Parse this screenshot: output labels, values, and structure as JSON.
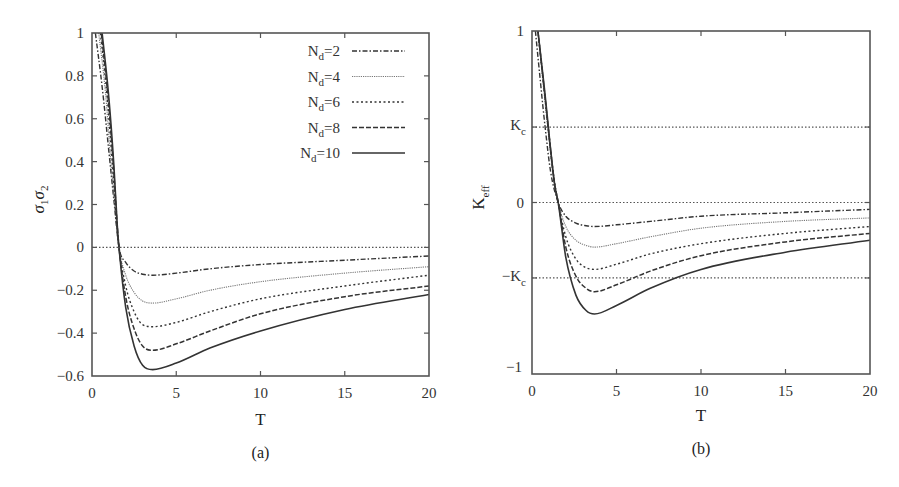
{
  "figure": {
    "panels": [
      "(a)",
      "(b)"
    ]
  },
  "chart_data": [
    {
      "type": "line",
      "panel_label": "(a)",
      "title": "",
      "xlabel": "T",
      "ylabel": "σ1σ2",
      "xlim": [
        0,
        20
      ],
      "ylim": [
        -0.6,
        1
      ],
      "xticks": [
        0,
        5,
        10,
        15,
        20
      ],
      "xtick_labels": [
        "0",
        "5",
        "10",
        "15",
        "20"
      ],
      "yticks": [
        1,
        0.8,
        0.6,
        0.4,
        0.2,
        0,
        -0.2,
        -0.4,
        -0.6
      ],
      "ytick_labels": [
        "1",
        "0.8",
        "0.6",
        "0.4",
        "0.2",
        "0",
        "−0.2",
        "−0.4",
        "−0.6"
      ],
      "grid": false,
      "legend_position": "upper right",
      "reference_lines": [
        {
          "y": 0,
          "style": "dotted"
        }
      ],
      "series": [
        {
          "name": "Nd=2",
          "style": "dashdot",
          "x": [
            0.2,
            0.6,
            1.0,
            1.3,
            1.6,
            2.0,
            2.5,
            3.0,
            3.6,
            5,
            7,
            10,
            15,
            20
          ],
          "y": [
            1.0,
            0.75,
            0.45,
            0.22,
            0.0,
            -0.07,
            -0.11,
            -0.125,
            -0.13,
            -0.12,
            -0.1,
            -0.08,
            -0.06,
            -0.04
          ]
        },
        {
          "name": "Nd=4",
          "style": "dotted-fine",
          "x": [
            0.4,
            0.8,
            1.1,
            1.4,
            1.6,
            2.0,
            2.5,
            3.0,
            3.6,
            5,
            7,
            10,
            15,
            20
          ],
          "y": [
            1.0,
            0.72,
            0.42,
            0.15,
            0.0,
            -0.13,
            -0.21,
            -0.25,
            -0.26,
            -0.24,
            -0.2,
            -0.16,
            -0.12,
            -0.09
          ]
        },
        {
          "name": "Nd=6",
          "style": "dotted",
          "x": [
            0.5,
            0.9,
            1.2,
            1.45,
            1.6,
            2.0,
            2.5,
            3.0,
            3.6,
            5,
            7,
            10,
            15,
            20
          ],
          "y": [
            1.0,
            0.7,
            0.4,
            0.12,
            0.0,
            -0.18,
            -0.3,
            -0.36,
            -0.37,
            -0.35,
            -0.3,
            -0.24,
            -0.18,
            -0.13
          ]
        },
        {
          "name": "Nd=8",
          "style": "dashed",
          "x": [
            0.55,
            0.95,
            1.25,
            1.5,
            1.6,
            2.0,
            2.5,
            3.0,
            3.6,
            5,
            7,
            10,
            15,
            20
          ],
          "y": [
            1.0,
            0.7,
            0.4,
            0.1,
            0.0,
            -0.23,
            -0.38,
            -0.46,
            -0.48,
            -0.45,
            -0.39,
            -0.31,
            -0.23,
            -0.18
          ]
        },
        {
          "name": "Nd=10",
          "style": "solid",
          "x": [
            0.6,
            1.0,
            1.3,
            1.5,
            1.6,
            2.0,
            2.5,
            3.0,
            3.6,
            5,
            7,
            10,
            15,
            20
          ],
          "y": [
            1.0,
            0.7,
            0.38,
            0.1,
            0.0,
            -0.28,
            -0.46,
            -0.55,
            -0.57,
            -0.54,
            -0.47,
            -0.39,
            -0.29,
            -0.22
          ]
        }
      ]
    },
    {
      "type": "line",
      "panel_label": "(b)",
      "title": "",
      "xlabel": "T",
      "ylabel": "Keff",
      "xlim": [
        0,
        20
      ],
      "ylim": [
        -1,
        1
      ],
      "xticks": [
        0,
        5,
        10,
        15,
        20
      ],
      "xtick_labels": [
        "0",
        "5",
        "10",
        "15",
        "20"
      ],
      "yticks": [
        1,
        0.44,
        0,
        -0.44,
        -1
      ],
      "ytick_labels": [
        "1",
        "Kc",
        "0",
        "−Kc",
        "−1"
      ],
      "grid": false,
      "reference_lines": [
        {
          "y": 0.44,
          "label": "Kc",
          "style": "dotted"
        },
        {
          "y": 0,
          "style": "dotted"
        },
        {
          "y": -0.44,
          "label": "−Kc",
          "style": "dotted"
        }
      ],
      "series": [
        {
          "name": "Nd=2",
          "style": "dashdot",
          "x": [
            0.2,
            0.5,
            0.8,
            1.1,
            1.55,
            2.0,
            2.6,
            3.2,
            3.7,
            5,
            7,
            10,
            15,
            20
          ],
          "y": [
            1.0,
            0.7,
            0.42,
            0.18,
            0.0,
            -0.08,
            -0.12,
            -0.135,
            -0.14,
            -0.13,
            -0.11,
            -0.08,
            -0.06,
            -0.04
          ]
        },
        {
          "name": "Nd=4",
          "style": "dotted-fine",
          "x": [
            0.35,
            0.65,
            0.95,
            1.25,
            1.55,
            2.0,
            2.6,
            3.2,
            3.7,
            5,
            7,
            10,
            15,
            20
          ],
          "y": [
            1.0,
            0.7,
            0.42,
            0.16,
            0.0,
            -0.14,
            -0.22,
            -0.25,
            -0.26,
            -0.24,
            -0.2,
            -0.15,
            -0.11,
            -0.09
          ]
        },
        {
          "name": "Nd=6",
          "style": "dotted",
          "x": [
            0.35,
            0.7,
            1.0,
            1.3,
            1.55,
            2.0,
            2.6,
            3.2,
            3.7,
            5,
            7,
            10,
            15,
            20
          ],
          "y": [
            1.0,
            0.68,
            0.4,
            0.14,
            0.0,
            -0.2,
            -0.33,
            -0.38,
            -0.39,
            -0.36,
            -0.3,
            -0.24,
            -0.18,
            -0.14
          ]
        },
        {
          "name": "Nd=8",
          "style": "dashed",
          "x": [
            0.35,
            0.72,
            1.02,
            1.32,
            1.55,
            2.0,
            2.6,
            3.2,
            3.7,
            5,
            7,
            10,
            15,
            20
          ],
          "y": [
            1.0,
            0.66,
            0.38,
            0.12,
            0.0,
            -0.26,
            -0.43,
            -0.5,
            -0.52,
            -0.48,
            -0.4,
            -0.31,
            -0.23,
            -0.18
          ]
        },
        {
          "name": "Nd=10",
          "style": "solid",
          "x": [
            0.35,
            0.75,
            1.05,
            1.35,
            1.55,
            2.0,
            2.6,
            3.2,
            3.7,
            5,
            7,
            10,
            15,
            20
          ],
          "y": [
            1.0,
            0.65,
            0.36,
            0.1,
            0.0,
            -0.32,
            -0.54,
            -0.63,
            -0.65,
            -0.6,
            -0.5,
            -0.39,
            -0.29,
            -0.22
          ]
        }
      ]
    }
  ],
  "legend": {
    "items": [
      {
        "label_main": "N",
        "label_sub": "d",
        "label_rest": "=2",
        "style": "dashdot"
      },
      {
        "label_main": "N",
        "label_sub": "d",
        "label_rest": "=4",
        "style": "dotted-fine"
      },
      {
        "label_main": "N",
        "label_sub": "d",
        "label_rest": "=6",
        "style": "dotted"
      },
      {
        "label_main": "N",
        "label_sub": "d",
        "label_rest": "=8",
        "style": "dashed"
      },
      {
        "label_main": "N",
        "label_sub": "d",
        "label_rest": "=10",
        "style": "solid"
      }
    ]
  },
  "styles": {
    "axis_color": "#555555",
    "line_color": "#333333",
    "light_line_color": "#777777"
  }
}
